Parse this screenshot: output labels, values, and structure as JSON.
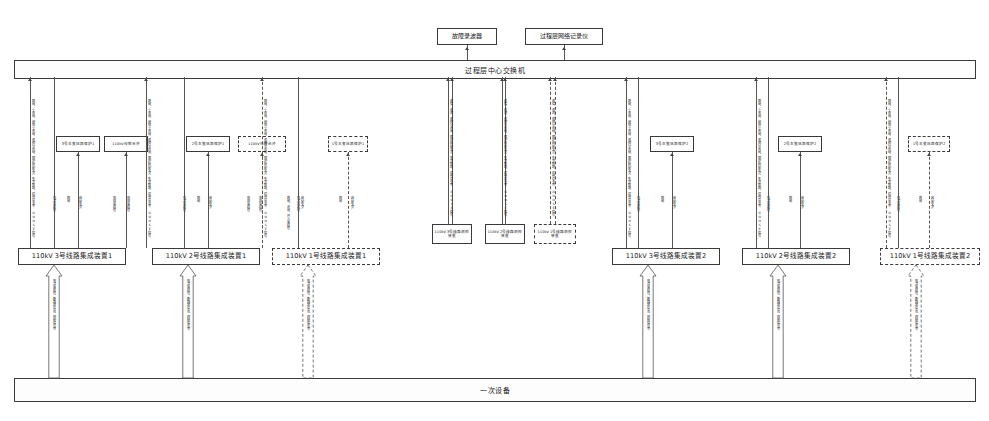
{
  "diagram": {
    "title_top_bus": "过程层中心交换机",
    "title_bottom_bus": "一次设备",
    "top_boxes": [
      {
        "id": "fault-recorder",
        "label": "故障录波器",
        "x": 437,
        "w": 60
      },
      {
        "id": "process-net-recorder",
        "label": "过程层网络记录仪",
        "x": 525,
        "w": 78
      }
    ],
    "devices": [
      {
        "id": "dev-l3-1",
        "label": "110kV 3号线路集成装置1",
        "x": 18,
        "w": 108,
        "dashed": false
      },
      {
        "id": "dev-l2-1",
        "label": "110kV 2号线路集成装置1",
        "x": 152,
        "w": 108,
        "dashed": false
      },
      {
        "id": "dev-l1-1",
        "label": "110kV 1号线路集成装置1",
        "x": 272,
        "w": 108,
        "dashed": true
      },
      {
        "id": "dev-l3-2",
        "label": "110kV 3号线路集成装置2",
        "x": 612,
        "w": 108,
        "dashed": false
      },
      {
        "id": "dev-l2-2",
        "label": "110kV 2号线路集成装置2",
        "x": 742,
        "w": 108,
        "dashed": false
      },
      {
        "id": "dev-l1-2",
        "label": "110kV 1号线路集成装置2",
        "x": 880,
        "w": 100,
        "dashed": true
      }
    ],
    "protection_boxes": [
      {
        "id": "prot-t3-1",
        "label": "3号主变压器保护1",
        "x": 56,
        "w": 44,
        "dashed": false
      },
      {
        "id": "bus-coupler-1",
        "label": "110kV母联合并",
        "x": 104,
        "w": 44,
        "dashed": false
      },
      {
        "id": "prot-t2-1",
        "label": "2号主变压器保护1",
        "x": 186,
        "w": 44,
        "dashed": false
      },
      {
        "id": "bus-coupler-2",
        "label": "110kV母联合并",
        "x": 238,
        "w": 48,
        "dashed": true
      },
      {
        "id": "prot-t1-1",
        "label": "1号主变压器保护1",
        "x": 328,
        "w": 40,
        "dashed": true
      },
      {
        "id": "prot-t3-2",
        "label": "3号主变压器保护2",
        "x": 650,
        "w": 44,
        "dashed": false
      },
      {
        "id": "prot-t2-2",
        "label": "2号主变压器保护2",
        "x": 778,
        "w": 44,
        "dashed": false
      },
      {
        "id": "prot-t1-2",
        "label": "1号主变压器保护2",
        "x": 908,
        "w": 42,
        "dashed": true
      }
    ],
    "measure_boxes": [
      {
        "id": "meas-l3",
        "label": "110kV 3号线路测控装置",
        "x": 432,
        "w": 40,
        "dashed": false
      },
      {
        "id": "meas-l2",
        "label": "110kV 2号线路测控装置",
        "x": 485,
        "w": 40,
        "dashed": false
      },
      {
        "id": "meas-l1",
        "label": "110kV 1号线路测控装置",
        "x": 534,
        "w": 42,
        "dashed": true
      }
    ],
    "long_annotations": [
      {
        "id": "ann-1",
        "x": 30,
        "text": "跳闸、重合闸、闭锁重合闸、遥控分合闸、保护启动失灵、失灵联跳、远传命令等 GOOSE信号"
      },
      {
        "id": "ann-2",
        "x": 146,
        "text": "跳闸、重合闸、闭锁重合闸、遥控分合闸、保护启动失灵、失灵联跳、远传命令等 GOOSE信号"
      },
      {
        "id": "ann-3",
        "x": 262,
        "text": "跳闸、重合闸、闭锁重合闸、遥控分合闸、保护启动失灵、失灵联跳、远传命令等 GOOSE信号"
      },
      {
        "id": "ann-4",
        "x": 448,
        "text": "遥信、遥测、遥控分合闸、保护启动失灵、失灵联跳、远传命令等 GOOSE信号"
      },
      {
        "id": "ann-5",
        "x": 502,
        "text": "遥信、遥测、遥控分合闸、保护启动失灵、失灵联跳、远传命令等 GOOSE信号"
      },
      {
        "id": "ann-6",
        "x": 550,
        "text": "遥信、遥测、遥控分合闸、保护启动失灵、失灵联跳、远传命令等 GOOSE信号"
      },
      {
        "id": "ann-7",
        "x": 626,
        "text": "跳闸、重合闸、闭锁重合闸、遥控分合闸、保护启动失灵、失灵联跳、远传命令等 GOOSE信号"
      },
      {
        "id": "ann-8",
        "x": 756,
        "text": "跳闸、重合闸、闭锁重合闸、遥控分合闸、保护启动失灵、失灵联跳、远传命令等 GOOSE信号"
      },
      {
        "id": "ann-9",
        "x": 886,
        "text": "跳闸、重合闸、闭锁重合闸、遥控分合闸、保护启动失灵、失灵联跳、远传命令等 GOOSE信号"
      }
    ],
    "short_annotations": [
      {
        "id": "sa-1",
        "x": 66,
        "text": "跳闸"
      },
      {
        "id": "sa-2",
        "x": 78,
        "text": "启动失灵"
      },
      {
        "id": "sa-3",
        "x": 112,
        "text": "电压采样值"
      },
      {
        "id": "sa-4",
        "x": 126,
        "text": "电压采样值"
      },
      {
        "id": "sa-5",
        "x": 196,
        "text": "跳闸"
      },
      {
        "id": "sa-6",
        "x": 208,
        "text": "启动失灵"
      },
      {
        "id": "sa-7",
        "x": 246,
        "text": "电压采样值"
      },
      {
        "id": "sa-8",
        "x": 258,
        "text": "电压采样值"
      },
      {
        "id": "sa-9",
        "x": 286,
        "text": "跳闸、合闸、开入采样值"
      },
      {
        "id": "sa-10",
        "x": 300,
        "text": "启动失灵"
      },
      {
        "id": "sa-11",
        "x": 338,
        "text": "跳闸"
      },
      {
        "id": "sa-12",
        "x": 350,
        "text": "启动失灵"
      },
      {
        "id": "sa-13",
        "x": 660,
        "text": "跳闸"
      },
      {
        "id": "sa-14",
        "x": 672,
        "text": "启动失灵"
      },
      {
        "id": "sa-15",
        "x": 788,
        "text": "跳闸"
      },
      {
        "id": "sa-16",
        "x": 800,
        "text": "启动失灵"
      },
      {
        "id": "sa-17",
        "x": 918,
        "text": "跳闸"
      },
      {
        "id": "sa-18",
        "x": 930,
        "text": "启动失灵"
      }
    ],
    "bus_annotations": [
      {
        "id": "ba-1",
        "x": 52,
        "text": "电流采样值"
      },
      {
        "id": "ba-2",
        "x": 182,
        "text": "电流采样值"
      },
      {
        "id": "ba-3",
        "x": 296,
        "text": "电流采样值"
      },
      {
        "id": "ba-4",
        "x": 636,
        "text": "电流采样值"
      },
      {
        "id": "ba-5",
        "x": 766,
        "text": "电流采样值"
      },
      {
        "id": "ba-6",
        "x": 896,
        "text": "电流采样值"
      }
    ],
    "primary_arrows": [
      {
        "id": "parrow-1",
        "x": 54,
        "text": "电流采样值、断路器位置、控制信号等",
        "dashed": false
      },
      {
        "id": "parrow-2",
        "x": 188,
        "text": "电流采样值、断路器位置、控制信号等",
        "dashed": false
      },
      {
        "id": "parrow-3",
        "x": 308,
        "text": "电流采样值、断路器位置、控制信号等",
        "dashed": true
      },
      {
        "id": "parrow-4",
        "x": 648,
        "text": "电流采样值、断路器位置、控制信号等",
        "dashed": false
      },
      {
        "id": "parrow-5",
        "x": 778,
        "text": "电流采样值、断路器位置、控制信号等",
        "dashed": false
      },
      {
        "id": "parrow-6",
        "x": 916,
        "text": "电流采样值、断路器位置、控制信号等",
        "dashed": true
      }
    ]
  }
}
